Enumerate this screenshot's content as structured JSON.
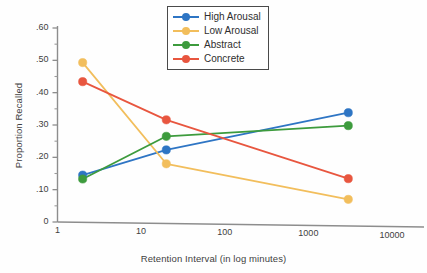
{
  "chart_data": {
    "type": "line",
    "title": "",
    "xlabel": "Retention Interval (in log minutes)",
    "ylabel": "Proportion Recalled",
    "x_scale": "log",
    "x": [
      2,
      20,
      3000
    ],
    "xlim": [
      1,
      10000
    ],
    "ylim": [
      0,
      0.6
    ],
    "grid": false,
    "legend_position": "top-center",
    "xtick_labels": [
      "1",
      "10",
      "100",
      "1000",
      "10000"
    ],
    "xtick_values": [
      1,
      10,
      100,
      1000,
      10000
    ],
    "ytick_labels": [
      ".60",
      ".50",
      ".40",
      ".30",
      ".20",
      ".10",
      "0"
    ],
    "ytick_values": [
      0.6,
      0.5,
      0.4,
      0.3,
      0.2,
      0.1,
      0
    ],
    "yminor_values": [
      0.55,
      0.45,
      0.35,
      0.25,
      0.15,
      0.05
    ],
    "series": [
      {
        "name": "High Arousal",
        "color": "#2E75C4",
        "values": [
          0.145,
          0.223,
          0.338
        ]
      },
      {
        "name": "Low Arousal",
        "color": "#F2BE5C",
        "values": [
          0.493,
          0.18,
          0.07
        ]
      },
      {
        "name": "Abstract",
        "color": "#3D9B3D",
        "values": [
          0.133,
          0.265,
          0.298
        ]
      },
      {
        "name": "Concrete",
        "color": "#E8563F",
        "values": [
          0.434,
          0.316,
          0.134
        ]
      }
    ]
  },
  "legend": {
    "items": [
      {
        "label": "High Arousal"
      },
      {
        "label": "Low Arousal"
      },
      {
        "label": "Abstract"
      },
      {
        "label": "Concrete"
      }
    ]
  },
  "axes": {
    "x_title": "Retention Interval (in log minutes)",
    "y_title": "Proportion Recalled"
  }
}
